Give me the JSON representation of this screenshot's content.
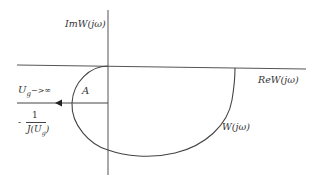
{
  "diagram": {
    "type": "nyquist-describing-function",
    "axes": {
      "imaginary_label": "ImW(jω)",
      "real_label": "ReW(jω)"
    },
    "curve_label": "W(jω)",
    "region_label": "A",
    "arrow_label_main": "U",
    "arrow_label_sub": "g",
    "arrow_label_tail": "−>∞",
    "describing_function": {
      "minus": "-",
      "numerator": "1",
      "denominator_prefix": "J(U",
      "denominator_sub": "g",
      "denominator_suffix": ")"
    },
    "colors": {
      "line": "#444444",
      "text": "#333333",
      "background": "#ffffff"
    }
  }
}
